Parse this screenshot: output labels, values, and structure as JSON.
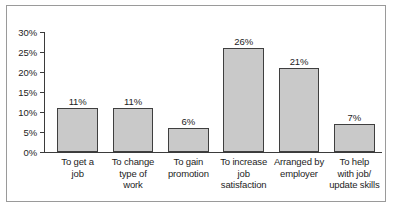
{
  "chart_data": {
    "type": "bar",
    "title": "",
    "xlabel": "",
    "ylabel": "",
    "categories": [
      "To get a\njob",
      "To change\ntype of\nwork",
      "To gain\npromotion",
      "To increase\njob\nsatisfaction",
      "Arranged by\nemployer",
      "To help\nwith job/\nupdate skills"
    ],
    "values": [
      11,
      11,
      6,
      26,
      21,
      7
    ],
    "value_labels": [
      "11%",
      "11%",
      "6%",
      "26%",
      "21%",
      "7%"
    ],
    "ylim": [
      0,
      30
    ],
    "ytick_values": [
      30,
      25,
      20,
      15,
      10,
      5,
      0
    ],
    "ytick_labels": [
      "30%",
      "25%",
      "20%",
      "15%",
      "10%",
      "5%",
      "0%"
    ],
    "grid": false,
    "legend": null,
    "bar_fill_color": "#c9c9c9",
    "bar_border_color": "#3f3f3f",
    "axis_color": "#3b3b3b",
    "text_color": "#1d1d1d",
    "frame_color": "#9a9a9a",
    "background_color": "#ffffff"
  }
}
